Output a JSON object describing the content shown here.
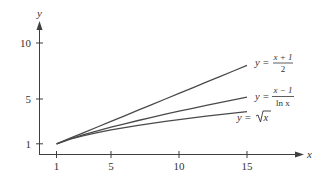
{
  "chart_data": {
    "type": "line",
    "title": "",
    "xlabel": "x",
    "ylabel": "y",
    "x_ticks": [
      1,
      5,
      10,
      15
    ],
    "y_ticks": [
      1,
      5,
      10
    ],
    "xlim": [
      0,
      18
    ],
    "ylim": [
      0,
      12
    ],
    "grid": false,
    "legend": "inline labels at right end of curves",
    "x": [
      1,
      2,
      3,
      4,
      5,
      6,
      7,
      8,
      9,
      10,
      11,
      12,
      13,
      14,
      15
    ],
    "series": [
      {
        "name": "y = (x+1)/2",
        "label_parts": {
          "lhs": "y =",
          "num": "x + 1",
          "den": "2"
        },
        "values": [
          1.0,
          1.5,
          2.0,
          2.5,
          3.0,
          3.5,
          4.0,
          4.5,
          5.0,
          5.5,
          6.0,
          6.5,
          7.0,
          7.5,
          8.0
        ]
      },
      {
        "name": "y = (x-1)/ln x",
        "label_parts": {
          "lhs": "y =",
          "num": "x − 1",
          "den": "ln x"
        },
        "values": [
          1.0,
          1.44,
          1.82,
          2.16,
          2.49,
          2.79,
          3.08,
          3.37,
          3.64,
          3.91,
          4.17,
          4.43,
          4.68,
          4.93,
          5.17
        ]
      },
      {
        "name": "y = sqrt(x)",
        "label_parts": {
          "lhs": "y =",
          "rad": "x"
        },
        "values": [
          1.0,
          1.41,
          1.73,
          2.0,
          2.24,
          2.45,
          2.65,
          2.83,
          3.0,
          3.16,
          3.32,
          3.46,
          3.61,
          3.74,
          3.87
        ]
      }
    ]
  },
  "axes": {
    "x_label": "x",
    "y_label": "y",
    "x_tick_labels": [
      "1",
      "5",
      "10",
      "15"
    ],
    "y_tick_labels": [
      "1",
      "5",
      "10"
    ]
  },
  "labels": {
    "lin": {
      "lhs": "y =",
      "num": "x + 1",
      "den": "2"
    },
    "log": {
      "lhs": "y =",
      "num": "x − 1",
      "den": "ln x"
    },
    "sqrt": {
      "lhs": "y =",
      "rad": "x"
    }
  },
  "colors": {
    "axis": "#3f3f3f",
    "curve": "#4a4a4a",
    "text": "#333333"
  }
}
